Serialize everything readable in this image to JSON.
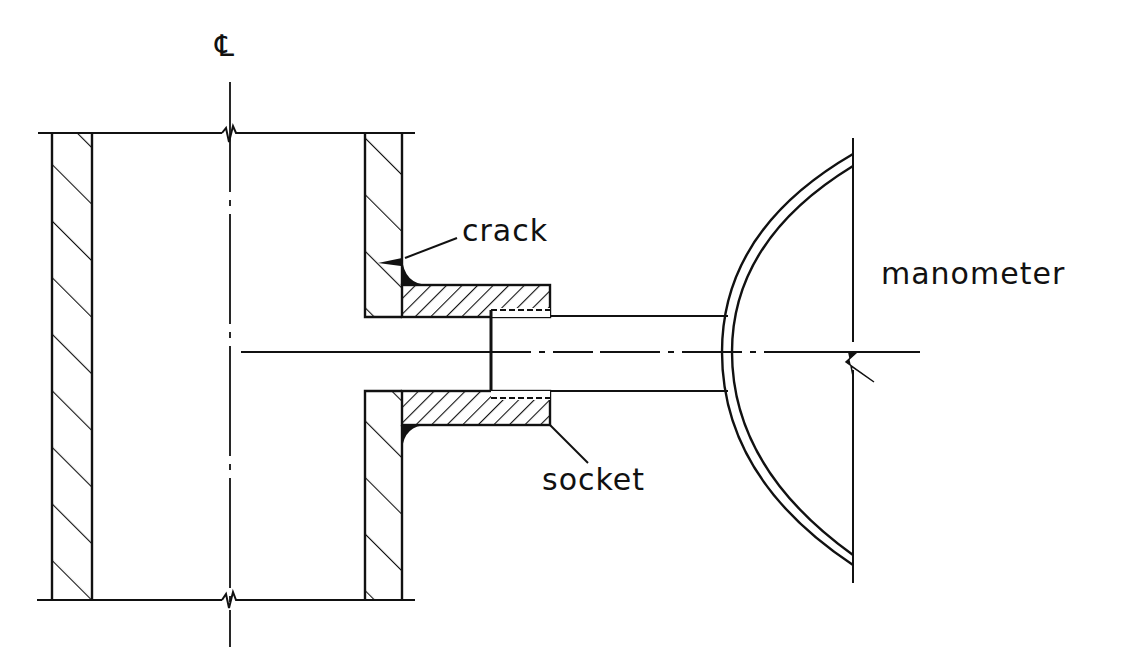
{
  "diagram": {
    "type": "technical section drawing",
    "labels": {
      "centerline_symbol": "℄",
      "crack": "crack",
      "socket": "socket",
      "manometer": "manometer"
    },
    "colors": {
      "line": "#111111",
      "background": "#ffffff"
    },
    "components": [
      {
        "id": "pipe-left-wall",
        "label": "pipe wall (left, hatched section)"
      },
      {
        "id": "pipe-right-wall",
        "label": "pipe wall (right, hatched section)"
      },
      {
        "id": "socket",
        "label": "socket"
      },
      {
        "id": "crack",
        "label": "crack"
      },
      {
        "id": "connecting-tube",
        "label": "tube"
      },
      {
        "id": "manometer",
        "label": "manometer"
      },
      {
        "id": "centerline",
        "label": "℄"
      }
    ]
  }
}
